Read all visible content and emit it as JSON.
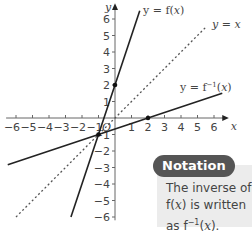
{
  "chart_data": {
    "type": "line",
    "title": "",
    "xlabel": "x",
    "ylabel": "y",
    "xlim": [
      -6,
      6
    ],
    "ylim": [
      -6,
      6
    ],
    "grid": false,
    "origin_label": "O",
    "x_ticks": [
      -6,
      -5,
      -4,
      -3,
      -2,
      -1,
      1,
      2,
      3,
      4,
      5,
      6
    ],
    "y_ticks": [
      -6,
      -5,
      -4,
      -3,
      -2,
      -1,
      1,
      2,
      3,
      4,
      5,
      6
    ],
    "x_tick_labels": [
      "−6",
      "−5",
      "−4",
      "−3",
      "−2",
      "−1",
      "1",
      "2",
      "3",
      "4",
      "5",
      "6"
    ],
    "y_tick_labels": [
      "−6",
      "−5",
      "−4",
      "−3",
      "−2",
      "−1",
      "1",
      "2",
      "3",
      "4",
      "5",
      "6"
    ],
    "series": [
      {
        "name": "y = f(x)",
        "style": "solid",
        "equation": "y = 3x + 2",
        "x": [
          -2.67,
          1.5
        ],
        "y": [
          -6,
          6.5
        ]
      },
      {
        "name": "y = x",
        "style": "dotted",
        "equation": "y = x",
        "x": [
          -6,
          5.5
        ],
        "y": [
          -6,
          5.5
        ]
      },
      {
        "name": "y = f⁻¹(x)",
        "style": "solid",
        "equation": "y = (x − 2)/3",
        "x": [
          -6.5,
          6.5
        ],
        "y": [
          -2.83,
          1.5
        ]
      }
    ],
    "marked_points": [
      {
        "x": 0,
        "y": 2
      },
      {
        "x": 2,
        "y": 0
      },
      {
        "x": -1,
        "y": -1
      }
    ],
    "annotations": [
      "y = f(x)",
      "y = x",
      "y = f⁻¹(x)"
    ]
  },
  "labels": {
    "f": {
      "pre": "y = f(",
      "var": "x",
      "post": ")"
    },
    "identity": {
      "pre": "y = ",
      "var": "x"
    },
    "finv": {
      "pre": "y = f",
      "sup": "−1",
      "mid": "(",
      "var": "x",
      "post": ")"
    },
    "axis_x": "x",
    "axis_y": "y",
    "origin": "O"
  },
  "notation": {
    "title": "Notation",
    "line1": "The inverse of",
    "line2_pre": "f(",
    "line2_var": "x",
    "line2_post": ") is written",
    "line3_pre": "as f",
    "line3_sup": "−1",
    "line3_mid": "(",
    "line3_var": "x",
    "line3_post": ")."
  }
}
